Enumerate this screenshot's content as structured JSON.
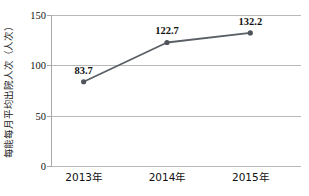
{
  "chart_data": {
    "type": "line",
    "title": "",
    "subtitle": "",
    "xlabel": "",
    "ylabel": "每能每月平均出院人次（人次）",
    "categories": [
      "2013年",
      "2014年",
      "2015年"
    ],
    "series": [
      {
        "name": "每能每月平均出院人次",
        "values": [
          83.7,
          122.7,
          132.2
        ]
      }
    ],
    "point_labels": [
      "83.7",
      "122.7",
      "132.2"
    ],
    "ylim": [
      0,
      150
    ],
    "yticks": [
      0,
      50,
      100,
      150
    ],
    "ytick_labels": [
      "0",
      "50",
      "100",
      "150"
    ],
    "grid": "horizontal",
    "legend": "none",
    "colors": {
      "line": "#5a5f66",
      "marker": "#4f545b",
      "grid": "#b9b9b9",
      "axis": "#a8a8a8",
      "text": "#111111",
      "background": "#ffffff"
    }
  }
}
